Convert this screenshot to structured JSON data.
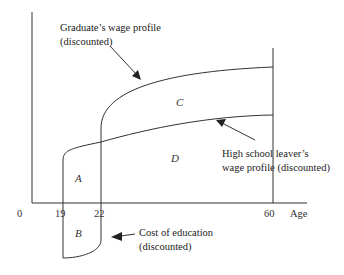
{
  "diagram": {
    "type": "human-capital-wage-profiles",
    "axis": {
      "origin_label": "0",
      "x_label": "Age",
      "ticks": [
        "19",
        "22",
        "60"
      ]
    },
    "regions": {
      "a": "A",
      "b": "B",
      "c": "C",
      "d": "D"
    },
    "annotations": {
      "graduate_line1": "Graduate’s wage profile",
      "graduate_line2": "(discounted)",
      "hs_line1": "High school leaver’s",
      "hs_line2": "wage profile (discounted)",
      "cost_line1": "Cost of education",
      "cost_line2": "(discounted)"
    },
    "colors": {
      "line": "#333333",
      "text": "#222222",
      "background": "#ffffff"
    }
  }
}
